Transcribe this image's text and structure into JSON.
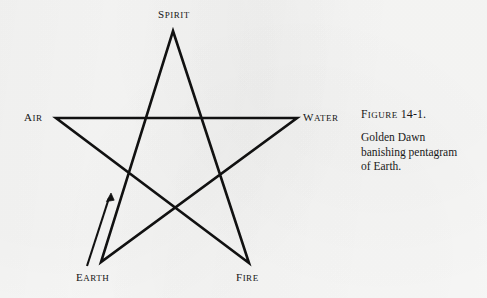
{
  "figure": {
    "background_color": "#f7f7f6",
    "ink_color": "#111111",
    "vertex_labels": {
      "spirit": "Spirit",
      "air": "Air",
      "water": "Water",
      "earth": "Earth",
      "fire": "Fire"
    },
    "arrow": {
      "name": "banishing-direction-arrow",
      "description": "Arrow from lower-left pointing up toward Spirit along the Earth-to-Spirit line",
      "from": [
        88,
        265
      ],
      "to": [
        111,
        194
      ]
    },
    "geometry": {
      "shape": "pentagram",
      "stroke_width": 2.6,
      "vertices": {
        "spirit": [
          173,
          31
        ],
        "water": [
          297,
          118
        ],
        "fire": [
          249,
          263
        ],
        "earth": [
          101,
          262
        ],
        "air": [
          56,
          118
        ]
      },
      "draw_order": [
        "spirit",
        "fire",
        "air",
        "water",
        "earth",
        "spirit"
      ]
    }
  },
  "caption": {
    "title_label": "Figure",
    "title_number": "14-1.",
    "lines": [
      "Golden Dawn",
      "banishing pentagram",
      "of Earth."
    ]
  }
}
